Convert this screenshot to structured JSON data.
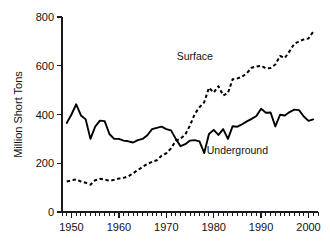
{
  "chart_data": {
    "type": "line",
    "title": "",
    "xlabel": "",
    "ylabel": "Million Short Tons",
    "xlim": [
      1948,
      2002
    ],
    "ylim": [
      0,
      800
    ],
    "xticks": [
      1950,
      1960,
      1970,
      1980,
      1990,
      2000
    ],
    "xtick_labels": [
      "1950",
      "1960",
      "1970",
      "1980",
      "1990",
      "2000"
    ],
    "xminor_step": 1,
    "yticks": [
      0,
      200,
      400,
      600,
      800
    ],
    "ytick_labels": [
      "0",
      "200",
      "400",
      "600",
      "800"
    ],
    "grid": false,
    "legend_position": "inline-annotations",
    "x": [
      1949,
      1950,
      1951,
      1952,
      1953,
      1954,
      1955,
      1956,
      1957,
      1958,
      1959,
      1960,
      1961,
      1962,
      1963,
      1964,
      1965,
      1966,
      1967,
      1968,
      1969,
      1970,
      1971,
      1972,
      1973,
      1974,
      1975,
      1976,
      1977,
      1978,
      1979,
      1980,
      1981,
      1982,
      1983,
      1984,
      1985,
      1986,
      1987,
      1988,
      1989,
      1990,
      1991,
      1992,
      1993,
      1994,
      1995,
      1996,
      1997,
      1998,
      1999,
      2000,
      2001
    ],
    "series": [
      {
        "name": "Underground",
        "style": "solid",
        "label": "Underground",
        "label_x": 1985,
        "label_y": 238,
        "values": [
          365,
          400,
          442,
          396,
          380,
          300,
          350,
          375,
          373,
          320,
          300,
          300,
          293,
          290,
          285,
          295,
          300,
          315,
          340,
          345,
          350,
          340,
          335,
          300,
          270,
          278,
          293,
          295,
          290,
          242,
          320,
          337,
          316,
          340,
          300,
          352,
          350,
          360,
          372,
          382,
          394,
          424,
          407,
          408,
          351,
          399,
          396,
          410,
          420,
          418,
          392,
          374,
          380
        ]
      },
      {
        "name": "Surface",
        "style": "dashed",
        "label": "Surface",
        "label_x": 1976,
        "label_y": 625,
        "values": [
          125,
          130,
          134,
          125,
          120,
          112,
          130,
          136,
          133,
          128,
          132,
          137,
          140,
          146,
          159,
          172,
          185,
          197,
          206,
          212,
          231,
          241,
          261,
          292,
          301,
          318,
          355,
          402,
          430,
          450,
          510,
          490,
          516,
          478,
          488,
          545,
          548,
          555,
          570,
          592,
          597,
          600,
          589,
          591,
          605,
          640,
          632,
          660,
          690,
          700,
          708,
          712,
          740
        ]
      }
    ],
    "annotations": [
      {
        "text": "Surface",
        "x": 1976,
        "y": 625
      },
      {
        "text": "Underground",
        "x": 1985,
        "y": 238
      }
    ]
  },
  "axes": {
    "y_axis_title": "Million Short Tons"
  }
}
